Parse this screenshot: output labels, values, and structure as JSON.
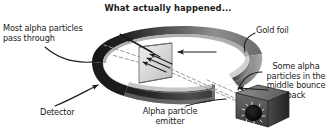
{
  "figure": {
    "title": "What actually happened..."
  },
  "labels": {
    "most_alpha": "Most alpha particles\npass through",
    "gold_foil": "Gold foil",
    "some_alpha": "Some alpha\nparticles in the\nmiddle bounce\nback",
    "detector": "Detector",
    "emitter": "Alpha particle\nemitter"
  },
  "colors": {
    "background": "#ffffff",
    "text": "#1b1b1b",
    "ring_dark": "#1c1c1c",
    "ring_mid": "#6e6e6e",
    "ring_light": "#b9b9b9",
    "ring_inner": "#d2d2d2",
    "foil_fill": "#d9d9d9",
    "foil_edge": "#8a8a8a",
    "emitter_body": "#4a4a4a",
    "emitter_aperture": "#0d0d0d",
    "ray_solid": "#1b1b1b",
    "ray_dashed": "#9a9a9a",
    "leader": "#1b1b1b"
  },
  "elements": {
    "detector_ring": "detector-ring",
    "gold_foil": "gold-foil-sheet",
    "emitter_box": "alpha-particle-emitter",
    "scattered_rays": "scattered-alpha-rays",
    "incident_rays": "incident-alpha-rays"
  }
}
